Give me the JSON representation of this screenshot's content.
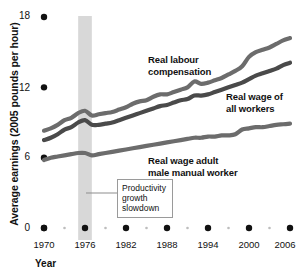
{
  "chart_data": {
    "type": "line",
    "title": "",
    "xlabel": "Year",
    "ylabel": "Average earnings (2005 pounds per hour)",
    "xlim": [
      1970,
      2006
    ],
    "ylim": [
      0,
      18
    ],
    "yticks": [
      0,
      6,
      12,
      18
    ],
    "ytick_labels": [
      "0",
      "6",
      "12",
      "18"
    ],
    "xticks": [
      1970,
      1976,
      1982,
      1988,
      1994,
      2000,
      2006
    ],
    "xtick_labels": [
      "1970",
      "1976",
      "1982",
      "1988",
      "1994",
      "2000",
      "2006"
    ],
    "minor_xticks": [
      1973,
      1979,
      1985,
      1991,
      1997,
      2003
    ],
    "grid": false,
    "legend_position": "inline-annotations",
    "x": [
      1970,
      1971,
      1972,
      1973,
      1974,
      1975,
      1976,
      1977,
      1978,
      1979,
      1980,
      1981,
      1982,
      1983,
      1984,
      1985,
      1986,
      1987,
      1988,
      1989,
      1990,
      1991,
      1992,
      1993,
      1994,
      1995,
      1996,
      1997,
      1998,
      1999,
      2000,
      2001,
      2002,
      2003,
      2004,
      2005,
      2006
    ],
    "series": [
      {
        "name": "Real labour compensation",
        "color": "#6c6c6c",
        "values": [
          8.3,
          8.5,
          8.8,
          9.2,
          9.4,
          9.8,
          10.0,
          9.6,
          9.7,
          9.8,
          9.9,
          10.1,
          10.3,
          10.6,
          10.8,
          10.9,
          11.2,
          11.4,
          11.4,
          11.6,
          11.8,
          12.0,
          12.5,
          12.3,
          12.4,
          12.6,
          12.8,
          13.1,
          13.4,
          13.8,
          14.6,
          15.0,
          15.2,
          15.4,
          15.7,
          16.0,
          16.2
        ]
      },
      {
        "name": "Real wage of all workers",
        "color": "#4a4a4a",
        "values": [
          7.5,
          7.7,
          8.0,
          8.4,
          8.6,
          9.0,
          9.2,
          8.8,
          8.8,
          8.9,
          9.0,
          9.2,
          9.4,
          9.6,
          9.8,
          10.0,
          10.2,
          10.4,
          10.5,
          10.7,
          10.9,
          11.0,
          11.3,
          11.3,
          11.4,
          11.6,
          11.8,
          12.0,
          12.2,
          12.4,
          12.7,
          13.0,
          13.2,
          13.4,
          13.6,
          13.9,
          14.1
        ]
      },
      {
        "name": "Real wage adult male manual worker",
        "color": "#6c6c6c",
        "values": [
          5.8,
          6.0,
          6.1,
          6.2,
          6.3,
          6.4,
          6.4,
          6.2,
          6.3,
          6.4,
          6.5,
          6.6,
          6.7,
          6.8,
          6.9,
          7.0,
          7.1,
          7.2,
          7.3,
          7.4,
          7.5,
          7.6,
          7.7,
          7.7,
          7.8,
          7.8,
          7.9,
          7.9,
          8.0,
          8.4,
          8.5,
          8.6,
          8.6,
          8.7,
          8.8,
          8.85,
          8.9
        ]
      }
    ],
    "annotations": [
      {
        "name": "productivity-growth-slowdown",
        "lines": [
          "Productivity",
          "growth",
          "slowdown"
        ],
        "band_start": 1975,
        "band_end": 1977,
        "band_color": "#d8d8d8"
      }
    ]
  },
  "series_labels": [
    {
      "lines": [
        "Real labour",
        "compensation"
      ]
    },
    {
      "lines": [
        "Real wage of",
        "all workers"
      ]
    },
    {
      "lines": [
        "Real wage adult",
        "male manual worker"
      ]
    }
  ]
}
